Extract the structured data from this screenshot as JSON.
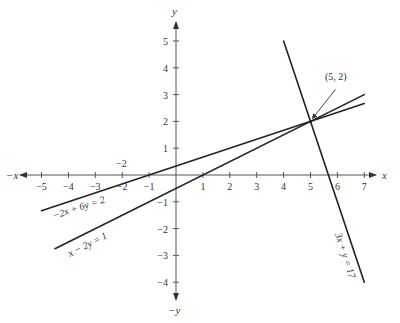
{
  "diagram": {
    "type": "coordinate-plane-lines",
    "axes": {
      "x_label": "x",
      "neg_x_label": "−x",
      "y_label": "y",
      "neg_y_label": "−y",
      "x_ticks": [
        -5,
        -4,
        -3,
        -2,
        -1,
        1,
        2,
        3,
        4,
        5,
        6,
        7
      ],
      "y_ticks": [
        -4,
        -3,
        -2,
        -1,
        1,
        2,
        3,
        4,
        5
      ],
      "x_range": [
        -5.7,
        7.7
      ],
      "y_range": [
        -4.7,
        5.6
      ],
      "extra_label": "−2"
    },
    "lines": [
      {
        "name": "line-a",
        "label": "−2x + 6y = 2",
        "a": -2,
        "b": 6,
        "c": 2,
        "x_from": -5,
        "x_to": 7
      },
      {
        "name": "line-b",
        "label": "x − 2y = 1",
        "a": 1,
        "b": -2,
        "c": 1,
        "x_from": -4.5,
        "x_to": 7
      },
      {
        "name": "line-c",
        "label": "3x + y = 17",
        "a": 3,
        "b": 1,
        "c": 17,
        "x_from": 4,
        "x_to": 7
      }
    ],
    "intersection": {
      "x": 5,
      "y": 2,
      "label": "(5, 2)"
    },
    "colors": {
      "line": "#222222",
      "axis": "#555555",
      "text": "#333333"
    }
  }
}
